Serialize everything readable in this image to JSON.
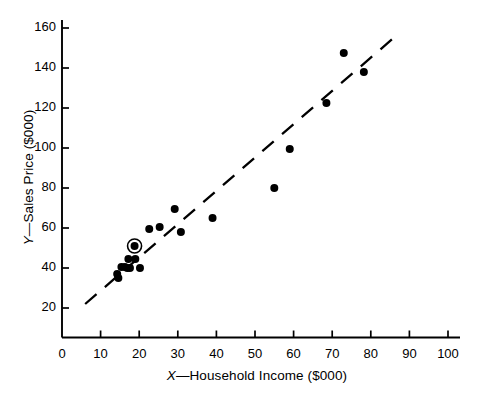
{
  "chart_data": {
    "type": "scatter",
    "title": "",
    "xlabel": "X—Household Income ($000)",
    "ylabel": "Y—Sales Price ($000)",
    "xlabel_prefix": "X",
    "xlabel_rest": "—Household Income ($000)",
    "ylabel_prefix": "Y",
    "ylabel_rest": "—Sales Price ($000)",
    "xlim": [
      0,
      105
    ],
    "ylim": [
      0,
      168
    ],
    "xticks": [
      0,
      10,
      20,
      30,
      40,
      50,
      60,
      70,
      80,
      90,
      100
    ],
    "xticklabels": [
      "0",
      "10",
      "20",
      "30",
      "40",
      "50",
      "60",
      "70",
      "80",
      "90",
      "100"
    ],
    "yticks": [
      20,
      40,
      60,
      80,
      100,
      120,
      140,
      160
    ],
    "yticklabels": [
      "20",
      "40",
      "60",
      "80",
      "100",
      "120",
      "140",
      "160"
    ],
    "grid": false,
    "legend": null,
    "marker": "filled-circle",
    "marker_color": "#000000",
    "axis_color": "#000000",
    "background": "#ffffff",
    "x": [
      14.3,
      14.6,
      15.4,
      16.3,
      16.9,
      17.2,
      17.6,
      18.8,
      19.0,
      20.2,
      22.6,
      25.3,
      29.2,
      30.8,
      39.0,
      55.0,
      59.0,
      68.5,
      73.0,
      78.2
    ],
    "y": [
      37.0,
      35.0,
      40.5,
      40.5,
      40.0,
      44.5,
      40.0,
      51.0,
      44.5,
      40.0,
      59.5,
      60.5,
      69.5,
      58.0,
      65.0,
      80.0,
      99.5,
      122.5,
      147.5,
      138.0
    ],
    "highlighted_point": {
      "x": 18.8,
      "y": 51.0,
      "style": "circled-outline"
    },
    "trendline": {
      "style": "dashed",
      "x": [
        6.0,
        86.5
      ],
      "y": [
        22.0,
        156.0
      ],
      "color": "#000000"
    }
  },
  "figure": {
    "axis_origin_label": "0"
  }
}
